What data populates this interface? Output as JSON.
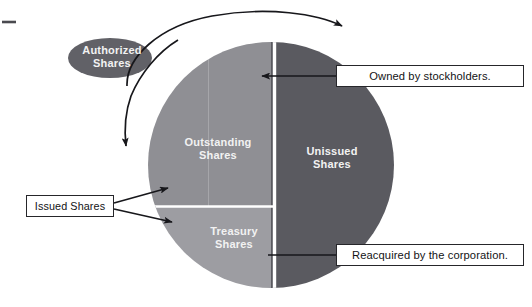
{
  "figure": {
    "type": "venn-pie-diagram",
    "background_color": "#ffffff"
  },
  "colors": {
    "authorized_ellipse": "#616167",
    "unissued_slice": "#5a5a60",
    "outstanding_slice": "#8e8e93",
    "treasury_slice": "#9c9ca1",
    "divider": "#ffffff",
    "outline": "#1a1a1e",
    "callout_border": "#26262a",
    "callout_text": "#131316",
    "slice_text": "#f2f2f2"
  },
  "shapes": {
    "authorized_ellipse": {
      "label": "Authorized\nShares",
      "cx": 110,
      "cy": 58,
      "rx": 42,
      "ry": 20
    },
    "circle": {
      "cx": 271,
      "cy": 165,
      "r": 123
    },
    "slices": [
      {
        "id": "outstanding",
        "label": "Outstanding\nShares",
        "region": "upper-left quadrant-half"
      },
      {
        "id": "treasury",
        "label": "Treasury\nShares",
        "region": "lower-left quadrant-half"
      },
      {
        "id": "unissued",
        "label": "Unissued\nShares",
        "region": "right half"
      }
    ]
  },
  "callouts": [
    {
      "id": "owned",
      "text": "Owned by stockholders.",
      "points_to": "outstanding"
    },
    {
      "id": "reacquired",
      "text": "Reacquired by the corporation.",
      "points_to": "treasury"
    },
    {
      "id": "issued",
      "text": "Issued Shares",
      "points_to": "outstanding + treasury"
    }
  ],
  "connectors": {
    "authorized_curve": "curved arrow from the Authorized Shares ellipse sweeping over the top of the circle, with arrowheads at both ends",
    "issued_arrows": 2,
    "owned_arrow": 1,
    "reacquired_arrow": 1
  },
  "marks": {
    "corner_dash": "short horizontal rule at upper-left margin"
  }
}
